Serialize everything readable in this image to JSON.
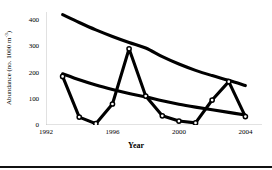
{
  "chart_data": {
    "type": "line",
    "title": "",
    "xlabel": "Year",
    "ylabel": "Abundance (no. 1000 m-3)",
    "ylabel_main": "Abundance (no. 1000 m",
    "ylabel_exponent": "-3",
    "ylabel_tail": ")",
    "xlim": [
      1992,
      2005
    ],
    "ylim": [
      0,
      430
    ],
    "grid": false,
    "legend": false,
    "legend_position": "none",
    "y_ticks": [
      0,
      100,
      200,
      300,
      400
    ],
    "y_tick_labels": [
      "0",
      "100",
      "200",
      "300",
      "400"
    ],
    "x_ticks": [
      1992,
      1996,
      2000,
      2004
    ],
    "x_tick_labels": [
      "1992",
      "1996",
      "2000",
      "2004"
    ],
    "x": [
      1993,
      1994,
      1995,
      1996,
      1997,
      1998,
      1999,
      2000,
      2001,
      2002,
      2003,
      2004
    ],
    "series": [
      {
        "name": "Observed abundance",
        "style": "line-with-open-circle-markers",
        "marker": "open-circle",
        "color": "#000000",
        "values": [
          185,
          30,
          5,
          80,
          290,
          110,
          35,
          15,
          8,
          95,
          165,
          32
        ]
      },
      {
        "name": "Upper fitted trend",
        "style": "smooth-curve",
        "marker": "none",
        "color": "#000000",
        "values": [
          420,
          390,
          362,
          337,
          314,
          293,
          260,
          232,
          208,
          188,
          170,
          150
        ]
      },
      {
        "name": "Lower fitted trend",
        "style": "smooth-curve",
        "marker": "none",
        "color": "#000000",
        "values": [
          195,
          172,
          152,
          135,
          120,
          107,
          92,
          79,
          68,
          58,
          48,
          38
        ]
      }
    ]
  },
  "figure": {
    "axis_color": "#bdbdbd",
    "line_color": "#000000",
    "background": "#ffffff",
    "rule_color": "#111111"
  }
}
